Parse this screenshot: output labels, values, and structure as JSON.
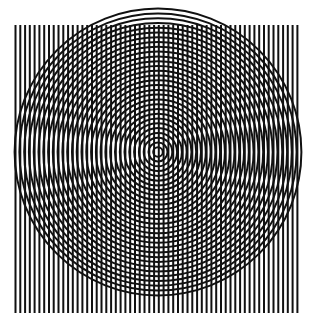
{
  "artwork": {
    "title": "Concentric Circles and Vertical Lines Moire Pattern",
    "canvas": {
      "width": 315,
      "height": 336,
      "background_color": "#ffffff"
    },
    "ink_color": "#111111",
    "layers": [
      {
        "name": "vertical-lines",
        "type": "parallel-vertical-lines",
        "count": 60,
        "x_start": 15.5,
        "x_end": 297.5,
        "spacing": 4.78,
        "y_top": 25,
        "y_bottom": 313,
        "stroke_width": 2.0,
        "color": "#111111"
      },
      {
        "name": "concentric-circles",
        "type": "concentric-circles",
        "count": 30,
        "center_x": 158,
        "center_y": 152,
        "radius_step": 4.78,
        "max_radius": 143,
        "stroke_width": 2.0,
        "color": "#111111"
      }
    ]
  },
  "chart_data": {
    "type": "scatter",
    "xlabel": "",
    "ylabel": "",
    "xlim": [
      0,
      315
    ],
    "ylim": [
      0,
      336
    ],
    "grid": false,
    "legend": "none",
    "series": [
      {
        "name": "vertical lines",
        "kind": "vertical-lines",
        "x": [
          15.5,
          20.3,
          25.1,
          29.8,
          34.6,
          39.4,
          44.2,
          49.0,
          53.7,
          58.5,
          63.3,
          68.1,
          72.8,
          77.6,
          82.4,
          87.2,
          92.0,
          96.7,
          101.5,
          106.3,
          111.1,
          115.8,
          120.6,
          125.4,
          130.2,
          135.0,
          139.7,
          144.5,
          149.3,
          154.1,
          158.8,
          163.6,
          168.4,
          173.2,
          178.0,
          182.7,
          187.5,
          192.3,
          197.1,
          201.8,
          206.6,
          211.4,
          216.2,
          221.0,
          225.7,
          230.5,
          235.3,
          240.1,
          244.8,
          249.6,
          254.4,
          259.2,
          264.0,
          268.7,
          273.5,
          278.3,
          283.1,
          287.8,
          292.6,
          297.4
        ],
        "y_top": 25,
        "y_bottom": 313
      },
      {
        "name": "concentric circles",
        "kind": "circles",
        "center": [
          158,
          152
        ],
        "radii": [
          4.8,
          9.5,
          14.3,
          19.1,
          23.9,
          28.7,
          33.5,
          38.2,
          43.0,
          47.8,
          52.6,
          57.4,
          62.1,
          66.9,
          71.7,
          76.5,
          81.3,
          86.0,
          90.8,
          95.6,
          100.4,
          105.2,
          109.9,
          114.7,
          119.5,
          124.3,
          129.1,
          133.8,
          138.6,
          143.4
        ]
      }
    ]
  }
}
